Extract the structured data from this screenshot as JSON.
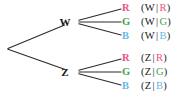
{
  "figure": {
    "type": "probability-tree-diagram",
    "background_color": "#ffffff",
    "line_color": "#2b2b2b",
    "text_color": "#1a1a1a"
  },
  "colors": {
    "R": "#e8537e",
    "G": "#3f9f52",
    "B": "#66b8e8",
    "black": "#1a1a1a"
  },
  "nodes": {
    "root": {
      "label": "",
      "x": 7,
      "y": 49
    },
    "w": {
      "label": "W",
      "x": 72,
      "y": 22
    },
    "z": {
      "label": "Z",
      "x": 72,
      "y": 72
    }
  },
  "branches": [
    {
      "from": "root",
      "to": "w"
    },
    {
      "from": "root",
      "to": "z"
    },
    {
      "from": "w",
      "to": "leaf0"
    },
    {
      "from": "w",
      "to": "leaf1"
    },
    {
      "from": "w",
      "to": "leaf2"
    },
    {
      "from": "z",
      "to": "leaf3"
    },
    {
      "from": "z",
      "to": "leaf4"
    },
    {
      "from": "z",
      "to": "leaf5"
    }
  ],
  "leaves": [
    {
      "id": "leaf0",
      "letter": "R",
      "letter_color": "#e8537e",
      "x": 125,
      "y": 8,
      "condition": {
        "open": "(",
        "first": "W",
        "bar": "|",
        "second": "R",
        "close": ")",
        "second_color": "#e8537e"
      }
    },
    {
      "id": "leaf1",
      "letter": "G",
      "letter_color": "#3f9f52",
      "x": 125,
      "y": 22,
      "condition": {
        "open": "(",
        "first": "W",
        "bar": "|",
        "second": "G",
        "close": ")",
        "second_color": "#3f9f52"
      }
    },
    {
      "id": "leaf2",
      "letter": "B",
      "letter_color": "#66b8e8",
      "x": 125,
      "y": 36,
      "condition": {
        "open": "(",
        "first": "W",
        "bar": "|",
        "second": "B",
        "close": ")",
        "second_color": "#66b8e8"
      }
    },
    {
      "id": "leaf3",
      "letter": "R",
      "letter_color": "#e8537e",
      "x": 125,
      "y": 58,
      "condition": {
        "open": "(",
        "first": "Z",
        "bar": "|",
        "second": "R",
        "close": ")",
        "second_color": "#e8537e"
      }
    },
    {
      "id": "leaf4",
      "letter": "G",
      "letter_color": "#3f9f52",
      "x": 125,
      "y": 72,
      "condition": {
        "open": "(",
        "first": "Z",
        "bar": "|",
        "second": "G",
        "close": ")",
        "second_color": "#3f9f52"
      }
    },
    {
      "id": "leaf5",
      "letter": "B",
      "letter_color": "#66b8e8",
      "x": 125,
      "y": 86,
      "condition": {
        "open": "(",
        "first": "Z",
        "bar": "|",
        "second": "B",
        "close": ")",
        "second_color": "#66b8e8"
      }
    }
  ]
}
